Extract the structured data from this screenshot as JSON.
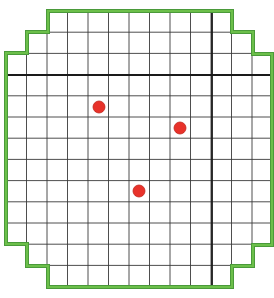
{
  "diagram": {
    "type": "grid-with-markers",
    "grid": {
      "columns": 13,
      "rows": 13,
      "x_lines": [
        6,
        26.5,
        47,
        67.5,
        88,
        108.5,
        129,
        149.5,
        170,
        190.5,
        211,
        231.5,
        252,
        272
      ],
      "y_lines": [
        11,
        32.2,
        53.4,
        74.6,
        95.8,
        117,
        138.2,
        159.4,
        180.6,
        201.8,
        223,
        244.2,
        265.4,
        287
      ],
      "line_color": "#3a3a3a",
      "cell_line_width": 0.9
    },
    "axes": {
      "vertical_axis_x": 212,
      "horizontal_axis_y": 75,
      "color": "#1a1a1a",
      "width": 1.8
    },
    "boundary": {
      "color": "#4a9a3a",
      "inner_color": "#6cbf4a",
      "width": 4,
      "points": [
        [
          6,
          53
        ],
        [
          27,
          53
        ],
        [
          27,
          32
        ],
        [
          48,
          32
        ],
        [
          48,
          11
        ],
        [
          232,
          11
        ],
        [
          232,
          32
        ],
        [
          253,
          32
        ],
        [
          253,
          54
        ],
        [
          272,
          54
        ],
        [
          272,
          245
        ],
        [
          253,
          245
        ],
        [
          253,
          266
        ],
        [
          232,
          266
        ],
        [
          232,
          287
        ],
        [
          48,
          287
        ],
        [
          48,
          266
        ],
        [
          27,
          266
        ],
        [
          27,
          244
        ],
        [
          6,
          244
        ]
      ]
    },
    "markers": [
      {
        "label": "point-1",
        "cx": 99,
        "cy": 107,
        "r": 6
      },
      {
        "label": "point-2",
        "cx": 180,
        "cy": 128,
        "r": 6
      },
      {
        "label": "point-3",
        "cx": 139,
        "cy": 191,
        "r": 6
      }
    ],
    "marker_color": "#e8322a",
    "marker_stroke": "#c0241c"
  }
}
